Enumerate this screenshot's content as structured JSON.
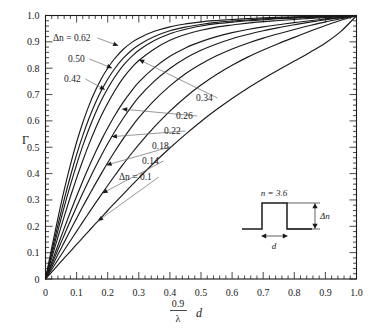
{
  "chart_data": {
    "type": "line",
    "title": "",
    "xlabel": "0.9/λ d",
    "xlabel_numerator": "0.9",
    "xlabel_denominator": "λ",
    "xlabel_variable": "d",
    "ylabel": "Γ",
    "xlim": [
      0,
      1.0
    ],
    "ylim": [
      0,
      1.0
    ],
    "grid": false,
    "legend_position": "inline-annotations",
    "xticks": [
      "0",
      "0.1",
      "0.2",
      "0.3",
      "0.4",
      "0.5",
      "0.6",
      "0.7",
      "0.8",
      "0.9",
      "1.0"
    ],
    "xtick_values": [
      0,
      0.1,
      0.2,
      0.3,
      0.4,
      0.5,
      0.6,
      0.7,
      0.8,
      0.9,
      1.0
    ],
    "yticks": [
      "0",
      "0.1",
      "0.2",
      "0.3",
      "0.4",
      "0.5",
      "0.6",
      "0.7",
      "0.8",
      "0.9",
      "1.0"
    ],
    "ytick_values": [
      0,
      0.1,
      0.2,
      0.3,
      0.4,
      0.5,
      0.6,
      0.7,
      0.8,
      0.9,
      1.0
    ],
    "minor_tick_step": 0.02,
    "x": [
      0,
      0.02,
      0.04,
      0.06,
      0.08,
      0.1,
      0.12,
      0.14,
      0.16,
      0.18,
      0.2,
      0.22,
      0.25,
      0.28,
      0.3,
      0.35,
      0.4,
      0.45,
      0.5,
      0.55,
      0.6,
      0.65,
      0.7,
      0.75,
      0.8,
      0.85,
      0.9,
      0.95,
      1.0
    ],
    "series": [
      {
        "name": "Δn = 0.62",
        "label": "0.62",
        "values": [
          0,
          0.118,
          0.231,
          0.337,
          0.433,
          0.519,
          0.594,
          0.659,
          0.714,
          0.761,
          0.8,
          0.833,
          0.872,
          0.9,
          0.914,
          0.94,
          0.957,
          0.968,
          0.976,
          0.981,
          0.985,
          0.988,
          0.991,
          0.993,
          0.995,
          0.996,
          0.997,
          0.998,
          0.999
        ]
      },
      {
        "name": "Δn = 0.50",
        "label": "0.50",
        "values": [
          0,
          0.104,
          0.205,
          0.301,
          0.39,
          0.472,
          0.545,
          0.61,
          0.667,
          0.716,
          0.758,
          0.794,
          0.838,
          0.871,
          0.888,
          0.92,
          0.942,
          0.956,
          0.966,
          0.974,
          0.979,
          0.983,
          0.987,
          0.99,
          0.992,
          0.994,
          0.996,
          0.997,
          0.999
        ]
      },
      {
        "name": "Δn = 0.42",
        "label": "0.42",
        "values": [
          0,
          0.093,
          0.184,
          0.273,
          0.356,
          0.434,
          0.506,
          0.57,
          0.628,
          0.679,
          0.723,
          0.762,
          0.811,
          0.848,
          0.868,
          0.905,
          0.931,
          0.948,
          0.96,
          0.969,
          0.975,
          0.98,
          0.984,
          0.988,
          0.99,
          0.993,
          0.995,
          0.997,
          0.999
        ]
      },
      {
        "name": "Δn = 0.34",
        "label": "0.34",
        "values": [
          0,
          0.08,
          0.159,
          0.237,
          0.312,
          0.383,
          0.45,
          0.512,
          0.569,
          0.621,
          0.667,
          0.709,
          0.763,
          0.806,
          0.829,
          0.873,
          0.906,
          0.928,
          0.944,
          0.956,
          0.964,
          0.971,
          0.977,
          0.981,
          0.985,
          0.989,
          0.992,
          0.996,
          0.999
        ]
      },
      {
        "name": "Δn = 0.26",
        "label": "0.26",
        "values": [
          0,
          0.064,
          0.128,
          0.192,
          0.254,
          0.314,
          0.372,
          0.427,
          0.479,
          0.528,
          0.573,
          0.615,
          0.671,
          0.719,
          0.747,
          0.802,
          0.845,
          0.877,
          0.901,
          0.92,
          0.935,
          0.947,
          0.957,
          0.965,
          0.973,
          0.98,
          0.987,
          0.993,
          0.999
        ]
      },
      {
        "name": "Δn = 0.22",
        "label": "0.22",
        "values": [
          0,
          0.055,
          0.111,
          0.166,
          0.221,
          0.274,
          0.326,
          0.376,
          0.424,
          0.47,
          0.513,
          0.554,
          0.61,
          0.66,
          0.69,
          0.751,
          0.799,
          0.838,
          0.868,
          0.892,
          0.912,
          0.928,
          0.942,
          0.954,
          0.965,
          0.975,
          0.984,
          0.992,
          0.999
        ]
      },
      {
        "name": "Δn = 0.18",
        "label": "0.18",
        "values": [
          0,
          0.046,
          0.093,
          0.139,
          0.185,
          0.23,
          0.275,
          0.318,
          0.36,
          0.401,
          0.441,
          0.479,
          0.533,
          0.582,
          0.612,
          0.678,
          0.733,
          0.779,
          0.816,
          0.847,
          0.873,
          0.895,
          0.914,
          0.931,
          0.947,
          0.962,
          0.976,
          0.988,
          0.999
        ]
      },
      {
        "name": "Δn = 0.14",
        "label": "0.14",
        "values": [
          0,
          0.036,
          0.073,
          0.109,
          0.145,
          0.181,
          0.217,
          0.252,
          0.287,
          0.321,
          0.355,
          0.388,
          0.436,
          0.481,
          0.51,
          0.577,
          0.637,
          0.69,
          0.736,
          0.776,
          0.811,
          0.842,
          0.869,
          0.894,
          0.917,
          0.94,
          0.962,
          0.982,
          0.999
        ]
      },
      {
        "name": "Δn = 0.1",
        "label": "Δn = 0.1",
        "values": [
          0,
          0.026,
          0.053,
          0.079,
          0.105,
          0.131,
          0.157,
          0.183,
          0.209,
          0.234,
          0.26,
          0.285,
          0.322,
          0.359,
          0.383,
          0.442,
          0.497,
          0.549,
          0.598,
          0.643,
          0.685,
          0.724,
          0.76,
          0.794,
          0.827,
          0.86,
          0.896,
          0.94,
          0.999
        ]
      }
    ],
    "annotations": [
      {
        "text": "Δn = 0.62",
        "target_x": 0.235,
        "target_y": 0.885
      },
      {
        "text": "0.50",
        "target_x": 0.215,
        "target_y": 0.8
      },
      {
        "text": "0.42",
        "target_x": 0.192,
        "target_y": 0.718
      },
      {
        "text": "0.34",
        "target_x": 0.3,
        "target_y": 0.833
      },
      {
        "text": "0.26",
        "target_x": 0.245,
        "target_y": 0.645
      },
      {
        "text": "0.22",
        "target_x": 0.212,
        "target_y": 0.54
      },
      {
        "text": "0.18",
        "target_x": 0.195,
        "target_y": 0.432
      },
      {
        "text": "0.14",
        "target_x": 0.182,
        "target_y": 0.325
      },
      {
        "text": "Δn = 0.1",
        "target_x": 0.168,
        "target_y": 0.22
      }
    ],
    "inset": {
      "top_label": "n = 3.6",
      "height_label": "Δn",
      "width_label": "d",
      "description": "rectangular refractive-index step profile"
    },
    "colors": {
      "curve": "#1a1a1a",
      "axis": "#1a1a1a",
      "leader": "#6b6b6b",
      "background": "#ffffff"
    }
  }
}
